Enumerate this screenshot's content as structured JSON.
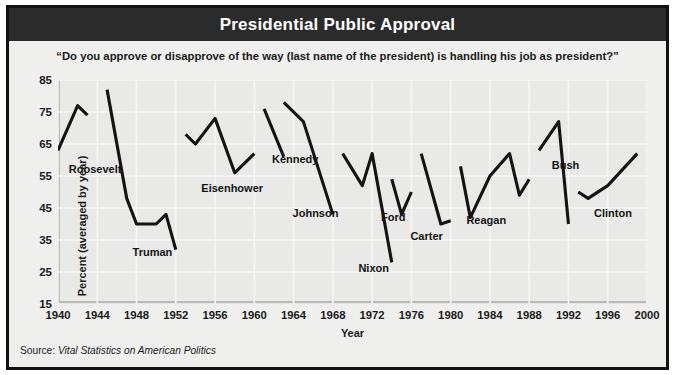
{
  "title": "Presidential Public Approval",
  "subtitle": "“Do you approve or disapprove of the way (last name of the president) is handling his job as president?”",
  "source": {
    "prefix": "Source: ",
    "work": "Vital Statistics on American Politics"
  },
  "colors": {
    "banner": "#2b2b2b",
    "frame": "#111111",
    "page": "#efefed",
    "plot_bg": "#e9e9e7",
    "gridline": "#f6f6f4",
    "line": "#141414",
    "axis": "#b9b9b6"
  },
  "chart_data": {
    "type": "line",
    "title": "Presidential Public Approval",
    "subtitle": "“Do you approve or disapprove of the way (last name of the president) is handling his job as president?”",
    "xlabel": "Year",
    "ylabel": "Percent (averaged by year)",
    "xlim": [
      1940,
      2000
    ],
    "ylim": [
      15,
      85
    ],
    "ytick_labels": [
      "85",
      "75",
      "65",
      "55",
      "45",
      "35",
      "25",
      "15"
    ],
    "yticks": [
      85,
      75,
      65,
      55,
      45,
      35,
      25,
      15
    ],
    "xticks": [
      1940,
      1944,
      1948,
      1952,
      1956,
      1960,
      1964,
      1968,
      1972,
      1976,
      1980,
      1984,
      1988,
      1992,
      1996,
      2000
    ],
    "xtick_labels": [
      "1940",
      "1944",
      "1948",
      "1952",
      "1956",
      "1960",
      "1964",
      "1968",
      "1972",
      "1976",
      "1980",
      "1984",
      "1988",
      "1992",
      "1996",
      "2000"
    ],
    "grid": true,
    "legend": "inline-annotations",
    "series": [
      {
        "name": "Roosevelt",
        "label_x": 1941.1,
        "label_y": 57,
        "x": [
          1940,
          1942,
          1943
        ],
        "values": [
          63,
          77,
          74
        ]
      },
      {
        "name": "Truman",
        "label_x": 1947.6,
        "label_y": 31,
        "x": [
          1945,
          1947,
          1948,
          1950,
          1951,
          1952
        ],
        "values": [
          82,
          48,
          40,
          40,
          43,
          32
        ]
      },
      {
        "name": "Eisenhower",
        "label_x": 1954.6,
        "label_y": 51,
        "x": [
          1953,
          1954,
          1956,
          1958,
          1960
        ],
        "values": [
          68,
          65,
          73,
          56,
          62
        ]
      },
      {
        "name": "Kennedy",
        "label_x": 1961.8,
        "label_y": 60,
        "x": [
          1961,
          1963
        ],
        "values": [
          76,
          61
        ]
      },
      {
        "name": "Johnson",
        "label_x": 1963.9,
        "label_y": 43,
        "x": [
          1963,
          1965,
          1968
        ],
        "values": [
          78,
          72,
          43
        ]
      },
      {
        "name": "Nixon",
        "label_x": 1970.6,
        "label_y": 26,
        "x": [
          1969,
          1971,
          1972,
          1974
        ],
        "values": [
          62,
          52,
          62,
          28
        ]
      },
      {
        "name": "Ford",
        "label_x": 1972.9,
        "label_y": 42,
        "x": [
          1974,
          1975,
          1976
        ],
        "values": [
          54,
          43,
          50
        ]
      },
      {
        "name": "Carter",
        "label_x": 1975.9,
        "label_y": 36,
        "x": [
          1977,
          1979,
          1980
        ],
        "values": [
          62,
          40,
          41
        ]
      },
      {
        "name": "Reagan",
        "label_x": 1981.6,
        "label_y": 41,
        "x": [
          1981,
          1982,
          1984,
          1986,
          1987,
          1988
        ],
        "values": [
          58,
          42,
          55,
          62,
          49,
          54
        ]
      },
      {
        "name": "Bush",
        "label_x": 1990.3,
        "label_y": 58,
        "x": [
          1989,
          1991,
          1992
        ],
        "values": [
          63,
          72,
          40
        ]
      },
      {
        "name": "Clinton",
        "label_x": 1994.6,
        "label_y": 43,
        "x": [
          1993,
          1994,
          1996,
          1999
        ],
        "values": [
          50,
          48,
          52,
          62
        ]
      }
    ]
  }
}
